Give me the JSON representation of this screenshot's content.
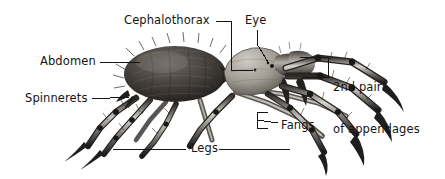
{
  "figure": {
    "style": "black-and-white engraving illustration with leader-line callout labels",
    "background_color": "#ffffff",
    "ink_color": "#151515",
    "labels": [
      {
        "id": "cephalothorax",
        "text": "Cephalothorax",
        "x": 124,
        "y": 14,
        "align": "left",
        "leader": "elbow-down-right"
      },
      {
        "id": "eye",
        "text": "Eye",
        "x": 245,
        "y": 14,
        "align": "left",
        "leader": "vertical-down"
      },
      {
        "id": "abdomen",
        "text": "Abdomen",
        "x": 40,
        "y": 55,
        "align": "left",
        "leader": "horizontal-right"
      },
      {
        "id": "second-pair-of-appendages",
        "text_line_1": "2nd pair",
        "text_line_2": "of appendages",
        "x": 333,
        "y": 52,
        "align": "left",
        "leader": "bracket-left"
      },
      {
        "id": "spinnerets",
        "text": "Spinnerets",
        "x": 25,
        "y": 92,
        "align": "left",
        "leader": "horizontal-right"
      },
      {
        "id": "fangs",
        "text": "Fangs",
        "x": 281,
        "y": 119,
        "align": "left",
        "leader": "bracket-left"
      },
      {
        "id": "legs",
        "text": "Legs",
        "x": 191,
        "y": 142,
        "align": "left",
        "leader": "horizontal-both"
      }
    ],
    "parts": [
      {
        "id": "abdomen",
        "label": "Abdomen"
      },
      {
        "id": "cephalothorax",
        "label": "Cephalothorax"
      },
      {
        "id": "eye",
        "label": "Eye"
      },
      {
        "id": "spinnerets",
        "label": "Spinnerets"
      },
      {
        "id": "fangs",
        "label": "Fangs"
      },
      {
        "id": "legs",
        "label": "Legs"
      },
      {
        "id": "second-pair-of-appendages",
        "label": "2nd pair of appendages"
      }
    ]
  }
}
